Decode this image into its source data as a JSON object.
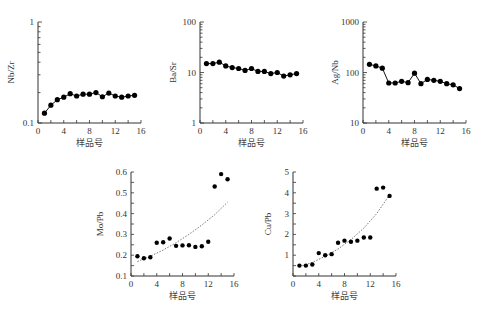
{
  "chart_data": [
    {
      "type": "line",
      "id": "nbzr",
      "ylabel": "Nb/Zr",
      "xlabel": "样品号",
      "yscale": "log",
      "ylim": [
        0.1,
        1
      ],
      "yticks": [
        0.1,
        1
      ],
      "ytick_labels": [
        "0.1",
        "1"
      ],
      "xlim": [
        0,
        16
      ],
      "xticks": [
        0,
        4,
        8,
        12,
        16
      ],
      "xtick_labels": [
        "0",
        "4",
        "8",
        "12",
        "16"
      ],
      "x": [
        1,
        2,
        3,
        4,
        5,
        6,
        7,
        8,
        9,
        10,
        11,
        12,
        13,
        14,
        15
      ],
      "values": [
        0.125,
        0.15,
        0.17,
        0.18,
        0.195,
        0.185,
        0.193,
        0.193,
        0.2,
        0.182,
        0.198,
        0.185,
        0.18,
        0.185,
        0.188
      ]
    },
    {
      "type": "line",
      "id": "basr",
      "ylabel": "Ba/Sr",
      "xlabel": "样品号",
      "yscale": "log",
      "ylim": [
        1,
        100
      ],
      "yticks": [
        1,
        10,
        100
      ],
      "ytick_labels": [
        "1",
        "10",
        "100"
      ],
      "xlim": [
        0,
        16
      ],
      "xticks": [
        0,
        4,
        8,
        12,
        16
      ],
      "xtick_labels": [
        "0",
        "4",
        "8",
        "12",
        "16"
      ],
      "x": [
        1,
        2,
        3,
        4,
        5,
        6,
        7,
        8,
        9,
        10,
        11,
        12,
        13,
        14,
        15
      ],
      "values": [
        15,
        15,
        16,
        13.5,
        12.5,
        12,
        11,
        12,
        10.5,
        10.5,
        9.5,
        10,
        8.5,
        9,
        9.5
      ]
    },
    {
      "type": "line",
      "id": "agnb",
      "ylabel": "Ag/Nb",
      "xlabel": "样品号",
      "yscale": "log",
      "ylim": [
        10,
        1000
      ],
      "yticks": [
        10,
        100,
        1000
      ],
      "ytick_labels": [
        "10",
        "100",
        "1000"
      ],
      "xlim": [
        0,
        16
      ],
      "xticks": [
        0,
        4,
        8,
        12,
        16
      ],
      "xtick_labels": [
        "0",
        "4",
        "8",
        "12",
        "16"
      ],
      "x": [
        1,
        2,
        3,
        4,
        5,
        6,
        7,
        8,
        9,
        10,
        11,
        12,
        13,
        14,
        15
      ],
      "values": [
        145,
        135,
        122,
        62,
        62,
        67,
        63,
        97,
        60,
        73,
        70,
        67,
        60,
        57,
        48
      ]
    },
    {
      "type": "scatter",
      "id": "mopb",
      "ylabel": "Mo/Pb",
      "xlabel": "样品号",
      "yscale": "linear",
      "ylim": [
        0.1,
        0.6
      ],
      "yticks": [
        0.1,
        0.2,
        0.3,
        0.4,
        0.5,
        0.6
      ],
      "ytick_labels": [
        "0.1",
        "0.2",
        "0.3",
        "0.4",
        "0.5",
        "0.6"
      ],
      "xlim": [
        0,
        16
      ],
      "xticks": [
        0,
        4,
        8,
        12,
        16
      ],
      "xtick_labels": [
        "0",
        "4",
        "8",
        "12",
        "16"
      ],
      "x": [
        1,
        2,
        3,
        4,
        5,
        6,
        7,
        8,
        9,
        10,
        11,
        12,
        13,
        14,
        15
      ],
      "values": [
        0.195,
        0.185,
        0.19,
        0.26,
        0.262,
        0.28,
        0.245,
        0.247,
        0.248,
        0.24,
        0.243,
        0.265,
        0.53,
        0.59,
        0.565
      ],
      "trendline": {
        "type": "exponential",
        "x": [
          1,
          3,
          5,
          7,
          9,
          11,
          13,
          15
        ],
        "y": [
          0.17,
          0.195,
          0.225,
          0.26,
          0.3,
          0.345,
          0.395,
          0.455
        ]
      }
    },
    {
      "type": "scatter",
      "id": "cupb",
      "ylabel": "Cu/Pb",
      "xlabel": "样品号",
      "yscale": "linear",
      "ylim": [
        0,
        5
      ],
      "yticks": [
        1,
        2,
        3,
        4,
        5
      ],
      "ytick_labels": [
        "1",
        "2",
        "3",
        "4",
        "5"
      ],
      "xlim": [
        0,
        16
      ],
      "xticks": [
        0,
        4,
        8,
        12,
        16
      ],
      "xtick_labels": [
        "0",
        "4",
        "8",
        "12",
        "16"
      ],
      "x": [
        1,
        2,
        3,
        4,
        5,
        6,
        7,
        8,
        9,
        10,
        11,
        12,
        13,
        14,
        15
      ],
      "values": [
        0.5,
        0.5,
        0.55,
        1.1,
        1.0,
        1.05,
        1.6,
        1.7,
        1.65,
        1.7,
        1.85,
        1.85,
        4.2,
        4.25,
        3.85
      ],
      "trendline": {
        "type": "polynomial",
        "x": [
          1,
          3,
          5,
          7,
          9,
          11,
          13,
          15
        ],
        "y": [
          0.45,
          0.65,
          0.95,
          1.3,
          1.75,
          2.3,
          3.0,
          3.9
        ]
      }
    }
  ]
}
